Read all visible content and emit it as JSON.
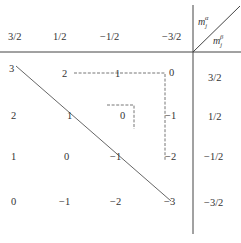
{
  "diagram": {
    "corner_label_top": {
      "base": "m",
      "sub": "j",
      "sup": "α"
    },
    "corner_label_bottom": {
      "base": "m",
      "sub": "j",
      "sup": "β"
    },
    "column_headers": [
      "3/2",
      "1/2",
      "−1/2",
      "−3/2"
    ],
    "row_headers": [
      "3/2",
      "1/2",
      "−1/2",
      "−3/2"
    ],
    "grid": [
      [
        "3",
        "2",
        "1",
        "0"
      ],
      [
        "2",
        "1",
        "0",
        "−1"
      ],
      [
        "1",
        "0",
        "−1",
        "−2"
      ],
      [
        "0",
        "−1",
        "−2",
        "−3"
      ]
    ],
    "solid_diagonal": "connects 3 → 1 → −1 → −3",
    "dashed_paths": [
      "2 → 1 → 0 → −1 → −2",
      "0 (small corner)"
    ]
  }
}
